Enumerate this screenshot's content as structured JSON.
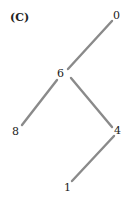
{
  "panel_label": "(C)",
  "tree": {
    "nodes": [
      {
        "id": "n0",
        "label": "0",
        "x": 116,
        "y": 19
      },
      {
        "id": "n6",
        "label": "6",
        "x": 61,
        "y": 75
      },
      {
        "id": "n8",
        "label": "8",
        "x": 16,
        "y": 135
      },
      {
        "id": "n4",
        "label": "4",
        "x": 117,
        "y": 134
      },
      {
        "id": "n1",
        "label": "1",
        "x": 67,
        "y": 191
      }
    ],
    "edges": [
      {
        "from": "0",
        "to": "6"
      },
      {
        "from": "6",
        "to": "8"
      },
      {
        "from": "6",
        "to": "4"
      },
      {
        "from": "4",
        "to": "1"
      }
    ]
  }
}
